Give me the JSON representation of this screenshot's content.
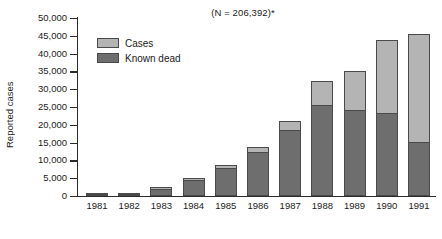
{
  "chart_data": {
    "type": "bar",
    "subtype": "stacked-vertical",
    "title": "(N = 206,392)*",
    "xlabel": "",
    "ylabel": "Reported cases",
    "categories": [
      "1981",
      "1982",
      "1983",
      "1984",
      "1985",
      "1986",
      "1987",
      "1988",
      "1989",
      "1990",
      "1991"
    ],
    "series": [
      {
        "name": "Known dead",
        "color": "#6e6e6e",
        "values": [
          300,
          700,
          2100,
          4600,
          8000,
          12300,
          18500,
          25700,
          24300,
          23200,
          15200
        ]
      },
      {
        "name": "Cases",
        "color": "#b4b4b4",
        "values": [
          100,
          200,
          300,
          400,
          800,
          1400,
          2600,
          6500,
          10700,
          20600,
          30300
        ]
      }
    ],
    "totals": [
      400,
      900,
      2400,
      5000,
      8800,
      13700,
      21100,
      32200,
      35000,
      43800,
      45500
    ],
    "ylim": [
      0,
      50000
    ],
    "yticks": [
      0,
      5000,
      10000,
      15000,
      20000,
      25000,
      30000,
      35000,
      40000,
      45000,
      50000
    ],
    "ytick_labels": [
      "0",
      "5,000",
      "10,000",
      "15,000",
      "20,000",
      "25,000",
      "30,000",
      "35,000",
      "40,000",
      "45,000",
      "50,000"
    ],
    "grid": false,
    "legend_position": "top-left",
    "legend_entries": [
      "Cases",
      "Known dead"
    ]
  },
  "legend": {
    "items": [
      {
        "label": "Cases",
        "swatch": "cases"
      },
      {
        "label": "Known dead",
        "swatch": "dead"
      }
    ]
  }
}
